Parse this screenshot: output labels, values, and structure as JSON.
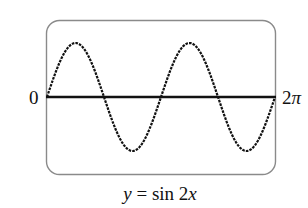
{
  "chart_data": {
    "type": "line",
    "title": "",
    "caption": "y = sin 2x",
    "function": "sin(2x)",
    "xlabel": "",
    "ylabel": "",
    "x_tick_labels": [
      "0",
      "2π"
    ],
    "xlim": [
      0,
      6.2832
    ],
    "ylim": [
      -1.2,
      1.2
    ],
    "grid": false,
    "legend": null,
    "series": [
      {
        "name": "y = sin 2x",
        "x": [
          0,
          0.3927,
          0.7854,
          1.1781,
          1.5708,
          1.9635,
          2.3562,
          2.7489,
          3.1416,
          3.5343,
          3.927,
          4.3197,
          4.7124,
          5.1051,
          5.4978,
          5.8905,
          6.2832
        ],
        "y": [
          0,
          0.707,
          1,
          0.707,
          0,
          -0.707,
          -1,
          -0.707,
          0,
          0.707,
          1,
          0.707,
          0,
          -0.707,
          -1,
          -0.707,
          0
        ]
      }
    ],
    "key_points": {
      "maxima_x": [
        "π/4",
        "5π/4"
      ],
      "minima_x": [
        "3π/4",
        "7π/4"
      ],
      "zeros_x": [
        "0",
        "π/2",
        "π",
        "3π/2",
        "2π"
      ],
      "max_y": 1,
      "min_y": -1
    }
  },
  "labels": {
    "x_min": "0",
    "x_max_num": "2",
    "x_max_sym": "π",
    "caption_y": "y",
    "caption_mid": " = sin 2",
    "caption_x": "x"
  },
  "style": {
    "curve_color": "#111111",
    "axis_color": "#111111",
    "frame_color": "#8a8a8a",
    "background": "#ffffff"
  }
}
